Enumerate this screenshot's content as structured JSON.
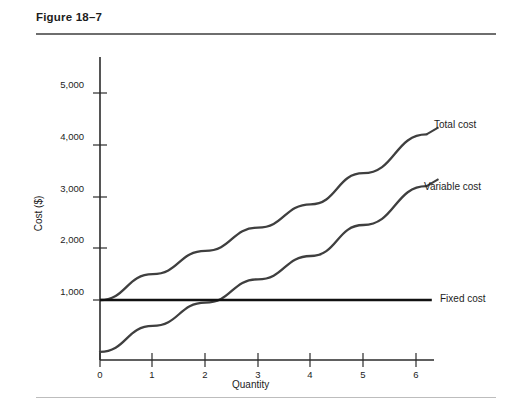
{
  "figure": {
    "title": "Figure 18–7"
  },
  "chart_data": {
    "type": "line",
    "title": "Figure 18–7",
    "xlabel": "Quantity",
    "ylabel": "Cost ($)",
    "xlim": [
      0,
      6.2
    ],
    "ylim": [
      0,
      5400
    ],
    "xticks": [
      0,
      1,
      2,
      3,
      4,
      5,
      6
    ],
    "xtick_labels": [
      "0",
      "1",
      "2",
      "3",
      "4",
      "5",
      "6"
    ],
    "yticks": [
      1000,
      2000,
      3000,
      4000,
      5000
    ],
    "ytick_labels": [
      "1,000",
      "2,000",
      "3,000",
      "4,000",
      "5,000"
    ],
    "grid": false,
    "legend_position": "right-of-curve-ends",
    "series": [
      {
        "name": "Total cost",
        "label": "Total cost",
        "color": "#3f3f3f",
        "x": [
          0,
          1,
          2,
          3,
          4,
          5,
          6.2
        ],
        "values": [
          1000,
          1500,
          1950,
          2400,
          2850,
          3450,
          4200
        ],
        "label_x": 6.35,
        "label_y": 4350
      },
      {
        "name": "Variable cost",
        "label": "Variable cost",
        "color": "#3f3f3f",
        "x": [
          0,
          1,
          2,
          3,
          4,
          5,
          6.2
        ],
        "values": [
          0,
          500,
          950,
          1400,
          1850,
          2450,
          3200
        ],
        "label_x": 6.35,
        "label_y": 3350
      },
      {
        "name": "Fixed cost",
        "label": "Fixed cost",
        "color": "#111111",
        "x": [
          0,
          6.3
        ],
        "values": [
          1000,
          1000
        ],
        "label_x": 6.55,
        "label_y": 1000
      }
    ]
  }
}
